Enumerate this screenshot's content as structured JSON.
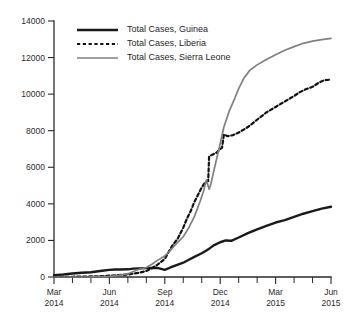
{
  "chart_data": {
    "type": "line",
    "title": "",
    "subtitle": "",
    "xlabel": "",
    "ylabel": "",
    "ylim": [
      0,
      14000
    ],
    "xlim": [
      "2014-03",
      "2015-06"
    ],
    "grid": false,
    "legend_position": "top-left",
    "y_ticks": [
      0,
      2000,
      4000,
      6000,
      8000,
      10000,
      12000,
      14000
    ],
    "y_tick_labels": [
      "0",
      "2000",
      "4000",
      "6000",
      "8000",
      "10000",
      "12000",
      "14000"
    ],
    "x_ticks": [
      "2014-03",
      "2014-06",
      "2014-09",
      "2014-12",
      "2015-03",
      "2015-06"
    ],
    "x_tick_labels": [
      {
        "month": "Mar",
        "year": "2014"
      },
      {
        "month": "Jun",
        "year": "2014"
      },
      {
        "month": "Sep",
        "year": "2014"
      },
      {
        "month": "Dec",
        "year": "2014"
      },
      {
        "month": "Mar",
        "year": "2015"
      },
      {
        "month": "Jun",
        "year": "2015"
      }
    ],
    "x_minor_tick_count_per_interval": 3,
    "series": [
      {
        "name": "Total Cases, Guinea",
        "color": "#1a1a1a",
        "style": "solid",
        "width": 2.4,
        "x": [
          0,
          0.5,
          1,
          1.5,
          2,
          2.3,
          2.6,
          3,
          3.3,
          3.6,
          4,
          4.3,
          4.6,
          5,
          5.3,
          5.6,
          6,
          6.3,
          6.6,
          7,
          7.3,
          7.6,
          8,
          8.3,
          8.5,
          8.7,
          9,
          9.3,
          9.6,
          10,
          10.5,
          11,
          11.5,
          12,
          12.5,
          13,
          13.5,
          14,
          14.5,
          15
        ],
        "values": [
          103,
          140,
          190,
          230,
          260,
          300,
          340,
          390,
          410,
          412,
          420,
          460,
          470,
          485,
          495,
          495,
          390,
          520,
          640,
          780,
          940,
          1100,
          1300,
          1480,
          1620,
          1760,
          1900,
          2000,
          1980,
          2160,
          2400,
          2600,
          2790,
          2980,
          3110,
          3290,
          3460,
          3600,
          3740,
          3840
        ]
      },
      {
        "name": "Total Cases, Liberia",
        "color": "#111111",
        "style": "dashed",
        "width": 2.2,
        "x": [
          0,
          0.5,
          1,
          1.5,
          2,
          2.5,
          3,
          3.5,
          4,
          4.3,
          4.6,
          5,
          5.3,
          5.6,
          6,
          6.2,
          6.4,
          6.7,
          7,
          7.2,
          7.4,
          7.6,
          7.8,
          8,
          8.2,
          8.35,
          8.4,
          8.6,
          8.8,
          9,
          9.1,
          9.2,
          9.4,
          9.7,
          10,
          10.5,
          11,
          11.5,
          12,
          12.5,
          13,
          13.3,
          13.6,
          14,
          14.3,
          14.6,
          15
        ],
        "values": [
          8,
          12,
          15,
          20,
          30,
          45,
          70,
          110,
          130,
          190,
          230,
          330,
          480,
          670,
          990,
          1350,
          1700,
          2100,
          2700,
          3200,
          3600,
          4100,
          4500,
          4900,
          5200,
          5250,
          6600,
          6700,
          6800,
          7000,
          7080,
          7800,
          7700,
          7760,
          7900,
          8200,
          8600,
          9000,
          9300,
          9600,
          9900,
          10100,
          10250,
          10400,
          10600,
          10750,
          10800
        ]
      },
      {
        "name": "Total Cases, Sierra Leone",
        "color": "#808080",
        "style": "solid",
        "width": 1.7,
        "x": [
          0,
          1,
          2,
          3,
          3.5,
          4,
          4.3,
          4.6,
          5,
          5.3,
          5.6,
          6,
          6.3,
          6.6,
          7,
          7.3,
          7.6,
          7.9,
          8.1,
          8.25,
          8.4,
          8.5,
          8.7,
          9,
          9.2,
          9.5,
          9.8,
          10,
          10.3,
          10.6,
          11,
          11.5,
          12,
          12.5,
          13,
          13.5,
          14,
          14.5,
          15
        ],
        "values": [
          0,
          0,
          2,
          30,
          90,
          180,
          300,
          420,
          520,
          700,
          910,
          1150,
          1450,
          1800,
          2200,
          2700,
          3300,
          4100,
          4700,
          5300,
          4800,
          5100,
          6000,
          7300,
          8200,
          9100,
          9800,
          10300,
          10900,
          11300,
          11600,
          11900,
          12150,
          12400,
          12600,
          12780,
          12900,
          12980,
          13050
        ]
      }
    ]
  },
  "legend": {
    "entries": [
      {
        "label": "Total Cases, Guinea"
      },
      {
        "label": "Total Cases, Liberia"
      },
      {
        "label": "Total Cases, Sierra Leone"
      }
    ]
  }
}
